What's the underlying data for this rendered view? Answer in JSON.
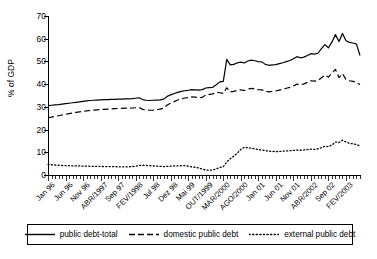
{
  "chart_data": {
    "type": "line",
    "title": "",
    "xlabel": "",
    "ylabel": "% of GDP",
    "ylim": [
      0,
      70
    ],
    "yticks": [
      0,
      10,
      20,
      30,
      40,
      50,
      60,
      70
    ],
    "grid": false,
    "legend_position": "bottom",
    "x_tick_labels": [
      "Jan 96",
      "Jun 96",
      "Nov 96",
      "ABR/1997",
      "Sep 97",
      "FEV/1998",
      "Jul 98",
      "Dez 98",
      "Mai 99",
      "OUT/1999",
      "MAR/2000",
      "AGO/2000",
      "Jan 01",
      "Jun 01",
      "Nov 01",
      "ABR/2002",
      "Sep 02",
      "FEV/2003"
    ],
    "x_tick_label_interval": 5,
    "n_points": 90,
    "series": [
      {
        "name": "public debt-total",
        "style": "solid",
        "values": [
          30.5,
          30.7,
          30.9,
          31.0,
          31.2,
          31.4,
          31.6,
          31.8,
          32.0,
          32.2,
          32.4,
          32.6,
          32.8,
          32.9,
          33.0,
          33.1,
          33.2,
          33.2,
          33.3,
          33.3,
          33.4,
          33.4,
          33.5,
          33.5,
          33.6,
          33.8,
          34.0,
          33.2,
          32.9,
          32.8,
          32.9,
          33.0,
          33.1,
          33.4,
          34.6,
          35.3,
          35.9,
          36.4,
          36.8,
          37.1,
          37.3,
          37.6,
          37.5,
          37.4,
          37.6,
          38.3,
          38.5,
          38.6,
          39.7,
          41.0,
          41.2,
          50.9,
          48.5,
          48.7,
          49.4,
          49.7,
          49.3,
          50.2,
          50.6,
          50.3,
          49.9,
          49.8,
          48.7,
          48.3,
          48.5,
          48.6,
          49.0,
          49.4,
          49.9,
          50.4,
          51.2,
          52.1,
          51.6,
          51.9,
          52.6,
          53.4,
          53.2,
          53.6,
          55.6,
          57.4,
          56.0,
          58.6,
          61.8,
          58.8,
          62.3,
          59.1,
          58.4,
          58.1,
          57.6,
          52.6
        ]
      },
      {
        "name": "domestic public debt",
        "style": "dashed",
        "values": [
          25.2,
          25.5,
          25.8,
          26.1,
          26.4,
          26.7,
          27.0,
          27.3,
          27.6,
          27.8,
          28.0,
          28.2,
          28.4,
          28.6,
          28.7,
          28.8,
          28.9,
          29.0,
          29.1,
          29.2,
          29.3,
          29.3,
          29.4,
          29.4,
          29.5,
          29.6,
          29.7,
          28.9,
          28.6,
          28.5,
          28.6,
          28.8,
          29.0,
          29.4,
          30.8,
          31.6,
          32.3,
          33.0,
          33.5,
          33.9,
          34.1,
          34.4,
          34.3,
          33.9,
          34.2,
          35.2,
          35.5,
          35.7,
          36.4,
          36.2,
          35.9,
          38.4,
          36.6,
          36.8,
          37.3,
          37.5,
          37.2,
          37.8,
          38.1,
          37.9,
          37.6,
          37.5,
          36.9,
          36.6,
          36.8,
          37.0,
          37.4,
          37.8,
          38.2,
          38.6,
          39.2,
          40.0,
          39.7,
          40.1,
          40.8,
          41.5,
          41.3,
          41.6,
          42.8,
          44.0,
          43.1,
          44.9,
          46.5,
          42.9,
          44.6,
          42.1,
          41.5,
          41.2,
          40.8,
          39.8
        ]
      },
      {
        "name": "external public debt",
        "style": "dotted",
        "values": [
          4.6,
          4.5,
          4.4,
          4.3,
          4.2,
          4.1,
          4.1,
          4.0,
          4.0,
          4.0,
          3.9,
          3.9,
          3.9,
          3.8,
          3.8,
          3.8,
          3.7,
          3.7,
          3.7,
          3.7,
          3.6,
          3.6,
          3.6,
          3.6,
          3.7,
          3.9,
          4.2,
          4.3,
          4.2,
          4.1,
          4.0,
          3.9,
          3.8,
          3.7,
          3.8,
          3.9,
          4.0,
          4.0,
          4.1,
          4.1,
          3.9,
          3.6,
          3.4,
          3.1,
          2.6,
          2.2,
          2.1,
          2.2,
          2.7,
          3.3,
          3.6,
          5.8,
          7.2,
          8.3,
          9.6,
          11.3,
          12.2,
          12.0,
          11.8,
          11.5,
          11.2,
          11.0,
          10.7,
          10.5,
          10.4,
          10.3,
          10.4,
          10.5,
          10.6,
          10.7,
          10.8,
          11.0,
          10.9,
          11.0,
          11.2,
          11.4,
          11.3,
          11.5,
          12.0,
          12.7,
          12.5,
          13.2,
          14.5,
          14.3,
          15.3,
          14.5,
          14.0,
          13.7,
          13.4,
          12.8
        ]
      }
    ]
  },
  "legend": {
    "items": [
      {
        "label": "public debt-total",
        "style": "solid"
      },
      {
        "label": "domestic public debt",
        "style": "dashed"
      },
      {
        "label": "external public debt",
        "style": "dotted"
      }
    ]
  }
}
